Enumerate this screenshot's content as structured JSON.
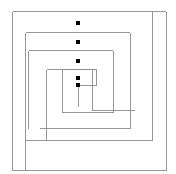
{
  "figure": {
    "width": 176,
    "height": 174,
    "background_color": "#ffffff"
  },
  "chart_data": {
    "type": "line",
    "title": "",
    "subtitle": "",
    "xlabel": "",
    "ylabel": "",
    "grid": false,
    "legend": null,
    "axis_visible": false,
    "xlim": [
      0,
      176
    ],
    "ylim": [
      0,
      174
    ],
    "series": [
      {
        "name": "outer-spiral-arm",
        "kind": "polyline",
        "stroke_color": "#8c8c8c",
        "stroke_width": 0.9,
        "points": [
          [
            12.5,
            170.5
          ],
          [
            12.5,
            11.5
          ],
          [
            166.0,
            11.5
          ],
          [
            166.0,
            170.5
          ],
          [
            12.5,
            170.5
          ]
        ]
      },
      {
        "name": "spiral-arm-1",
        "kind": "polyline",
        "stroke_color": "#8c8c8c",
        "stroke_width": 0.9,
        "points": [
          [
            152.0,
            11.5
          ],
          [
            152.0,
            140.5
          ],
          [
            25.5,
            140.5
          ]
        ]
      },
      {
        "name": "spiral-arm-2",
        "kind": "polyline",
        "stroke_color": "#8c8c8c",
        "stroke_width": 0.9,
        "points": [
          [
            25.5,
            170.5
          ],
          [
            25.5,
            32.5
          ],
          [
            130.0,
            32.5
          ],
          [
            130.0,
            128.5
          ],
          [
            39.5,
            128.5
          ]
        ]
      },
      {
        "name": "spiral-arm-3",
        "kind": "polyline",
        "stroke_color": "#8c8c8c",
        "stroke_width": 0.9,
        "points": [
          [
            28.5,
            128.5
          ],
          [
            28.5,
            50.5
          ],
          [
            113.0,
            50.5
          ],
          [
            113.0,
            112.5
          ],
          [
            62.5,
            112.5
          ]
        ]
      },
      {
        "name": "spiral-arm-4",
        "kind": "polyline",
        "stroke_color": "#8c8c8c",
        "stroke_width": 0.9,
        "points": [
          [
            62.5,
            112.5
          ],
          [
            62.5,
            69.5
          ],
          [
            92.0,
            69.5
          ],
          [
            92.0,
            110.5
          ],
          [
            135.0,
            110.5
          ]
        ]
      },
      {
        "name": "spiral-arm-5",
        "kind": "polyline",
        "stroke_color": "#8c8c8c",
        "stroke_width": 0.9,
        "points": [
          [
            46.5,
            140.5
          ],
          [
            46.5,
            69.5
          ],
          [
            96.5,
            69.5
          ],
          [
            96.5,
            85.5
          ],
          [
            78.0,
            85.5
          ]
        ]
      },
      {
        "name": "spiral-center-stub",
        "kind": "polyline",
        "stroke_color": "#8c8c8c",
        "stroke_width": 0.9,
        "points": [
          [
            78.0,
            85.5
          ],
          [
            78.0,
            107.0
          ]
        ]
      },
      {
        "name": "markers",
        "kind": "scatter",
        "marker": "square",
        "marker_color": "#000000",
        "marker_size": 3.4,
        "points": [
          [
            78,
            23
          ],
          [
            78,
            42
          ],
          [
            78,
            61
          ],
          [
            78,
            78
          ],
          [
            78,
            85
          ]
        ]
      }
    ]
  },
  "colors": {
    "stroke": "#8c8c8c",
    "marker": "#000000",
    "background": "#ffffff"
  }
}
